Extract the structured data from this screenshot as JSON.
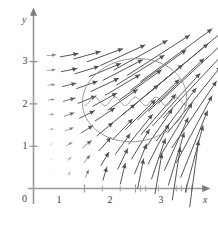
{
  "figure": {
    "title": "",
    "background": "#ffffff",
    "axis_color": "#9a9a9a",
    "arrow_color": "#4d4d4d",
    "curve_color": "#8a8a8a"
  },
  "axes": {
    "x_label": "x",
    "y_label": "y",
    "origin_label": "0",
    "x_ticks": [
      "1",
      "2",
      "3"
    ],
    "y_ticks": [
      "1",
      "2",
      "3"
    ],
    "x_range": [
      0,
      3.45
    ],
    "y_range": [
      0,
      3.45
    ]
  },
  "chart_data": {
    "type": "scatter",
    "title": "",
    "xlabel": "x",
    "ylabel": "y",
    "xlim": [
      0,
      3.45
    ],
    "ylim": [
      0,
      3.45
    ],
    "grid": false,
    "legend": "none",
    "x_ticks": [
      1,
      2,
      3
    ],
    "y_ticks": [
      1,
      2,
      3
    ],
    "x_minor_ticks": [
      1.0,
      1.35,
      1.7,
      2.0,
      2.1,
      2.2,
      2.45,
      2.8,
      2.9,
      3.0,
      3.1
    ],
    "vector_field": {
      "comment": "arrows on a grid; length and angle grow toward upper right",
      "x_samples": [
        0.35,
        0.7,
        1.05,
        1.4,
        1.75,
        2.1,
        2.45,
        2.8,
        3.15
      ],
      "y_samples": [
        0.35,
        0.7,
        1.05,
        1.4,
        1.75,
        2.1,
        2.45,
        2.8,
        3.15
      ],
      "u_expression": "x*y/6",
      "v_expression": "x*x/6",
      "scale": 0.95
    },
    "closed_curve": {
      "name": "region-boundary",
      "shape": "circle-like closed loop",
      "center": [
        2.0,
        2.05
      ],
      "radius": 1.0
    },
    "wavy_path": {
      "name": "oscillating-path",
      "y_center": 2.06,
      "amplitude": 0.1,
      "cycles": 5,
      "x_start": 1.0,
      "x_end": 3.0
    }
  }
}
